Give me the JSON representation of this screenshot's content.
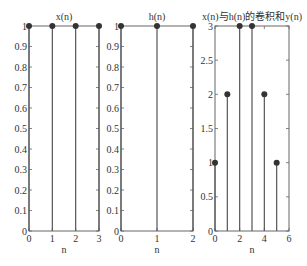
{
  "chart_data": [
    {
      "type": "stem",
      "title": "x(n)",
      "xlabel": "n",
      "ylabel": "",
      "x": [
        0,
        1,
        2,
        3
      ],
      "values": [
        1,
        1,
        1,
        1
      ],
      "xlim": [
        0,
        3
      ],
      "ylim": [
        0,
        1
      ],
      "xticks": [
        0,
        1,
        2,
        3
      ],
      "yticks": [
        0,
        0.1,
        0.2,
        0.3,
        0.4,
        0.5,
        0.6,
        0.7,
        0.8,
        0.9,
        1
      ],
      "grid": false
    },
    {
      "type": "stem",
      "title": "h(n)",
      "xlabel": "n",
      "ylabel": "",
      "x": [
        0,
        1,
        2
      ],
      "values": [
        1,
        1,
        1
      ],
      "xlim": [
        0,
        2
      ],
      "ylim": [
        0,
        1
      ],
      "xticks": [
        0,
        1,
        2
      ],
      "yticks": [
        0,
        0.1,
        0.2,
        0.3,
        0.4,
        0.5,
        0.6,
        0.7,
        0.8,
        0.9,
        1
      ],
      "grid": false
    },
    {
      "type": "stem",
      "title": "x(n)与h(n)的卷积和y(n)",
      "xlabel": "n",
      "ylabel": "",
      "x": [
        0,
        1,
        2,
        3,
        4,
        5
      ],
      "values": [
        1,
        2,
        3,
        3,
        2,
        1
      ],
      "xlim": [
        0,
        6
      ],
      "ylim": [
        0,
        3
      ],
      "xticks": [
        0,
        2,
        4,
        6
      ],
      "yticks": [
        0,
        0.5,
        1,
        1.5,
        2,
        2.5,
        3
      ],
      "grid": false
    }
  ],
  "layout": {
    "panels": [
      {
        "left": 29,
        "right": 99,
        "top": 26,
        "bottom": 231
      },
      {
        "left": 121,
        "right": 193,
        "top": 26,
        "bottom": 231
      },
      {
        "left": 215,
        "right": 289,
        "top": 26,
        "bottom": 231
      }
    ],
    "stem_color": "#555555",
    "marker_color": "#333333",
    "axis_color": "#666666"
  }
}
